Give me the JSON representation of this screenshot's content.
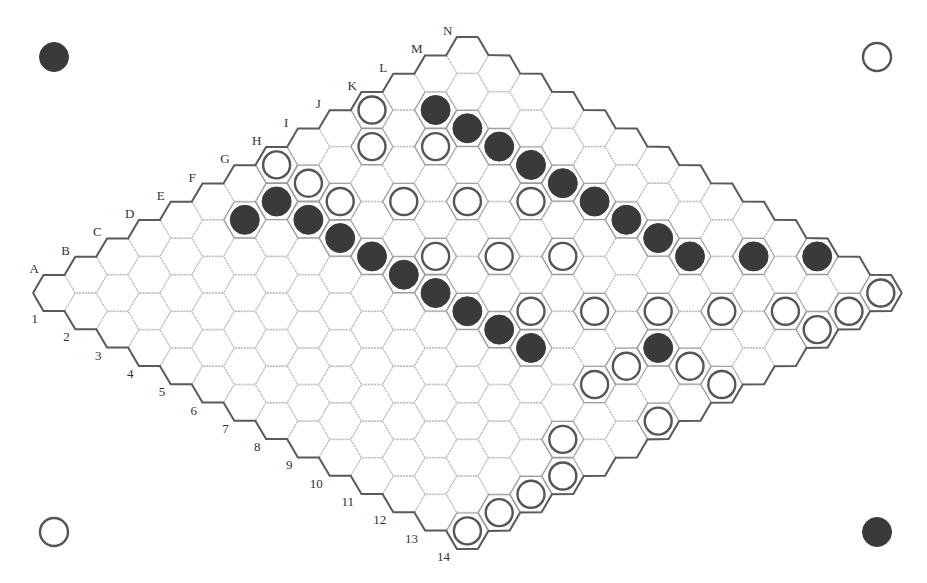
{
  "game": {
    "name": "Hex",
    "board_size": 14,
    "column_labels": [
      "A",
      "B",
      "C",
      "D",
      "E",
      "F",
      "G",
      "H",
      "I",
      "J",
      "K",
      "L",
      "M",
      "N"
    ],
    "row_labels": [
      "1",
      "2",
      "3",
      "4",
      "5",
      "6",
      "7",
      "8",
      "9",
      "10",
      "11",
      "12",
      "13",
      "14"
    ]
  },
  "colors": {
    "black_stone": "#3a3a3a",
    "white_stone_fill": "#ffffff",
    "white_stone_stroke": "#555555",
    "board_edge": "#5a5a5a",
    "grid": "#b8b8b8"
  },
  "corner_markers": [
    {
      "position": "top-left",
      "color": "black"
    },
    {
      "position": "top-right",
      "color": "white"
    },
    {
      "position": "bottom-left",
      "color": "white"
    },
    {
      "position": "bottom-right",
      "color": "black"
    }
  ],
  "stones": {
    "black": [
      "L2",
      "L3",
      "L4",
      "L5",
      "L6",
      "L7",
      "L8",
      "L9",
      "L10",
      "M11",
      "N12",
      "F2",
      "G2",
      "G3",
      "G4",
      "G5",
      "G6",
      "G7",
      "G8",
      "G9",
      "G10",
      "I12"
    ],
    "white": [
      "K1",
      "J2",
      "K3",
      "H1",
      "H2",
      "H3",
      "I4",
      "J5",
      "K6",
      "H6",
      "I7",
      "J8",
      "H9",
      "I10",
      "J11",
      "K12",
      "L13",
      "M14",
      "N14",
      "L14",
      "G12",
      "H12",
      "I13",
      "I14",
      "G14",
      "E13",
      "A14",
      "B14",
      "C14",
      "D14"
    ]
  }
}
